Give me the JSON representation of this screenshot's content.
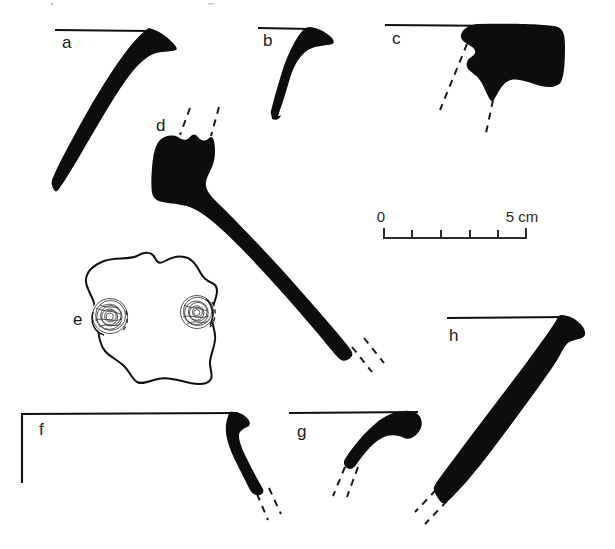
{
  "plate": {
    "kind": "archaeological-artifact-illustration-plate",
    "background_color": "#ffffff",
    "ink_color": "#0d0d0d",
    "width": 615,
    "height": 549
  },
  "figures": [
    {
      "id": "a",
      "label": "a",
      "label_x": 62,
      "label_y": 48,
      "description": "curved iron blade / knife with rim reference line at top",
      "has_rim_line": true,
      "has_break_dashes": false
    },
    {
      "id": "b",
      "label": "b",
      "label_x": 263,
      "label_y": 46,
      "description": "short tapering iron fragment with rim reference line",
      "has_rim_line": true,
      "has_break_dashes": false
    },
    {
      "id": "c",
      "label": "c",
      "label_x": 392,
      "label_y": 44,
      "description": "solid rounded rim sherd with two dashed profile projection lines",
      "has_rim_line": true,
      "has_break_dashes": true
    },
    {
      "id": "d",
      "label": "d",
      "label_x": 156,
      "label_y": 131,
      "description": "long curved hook / handle with dashed break lines at both ends",
      "has_rim_line": false,
      "has_break_dashes": true
    },
    {
      "id": "e",
      "label": "e",
      "label_x": 73,
      "label_y": 325,
      "description": "outlined irregular plate fragment with two hatched circular rivet bosses",
      "has_rim_line": false,
      "has_break_dashes": false
    },
    {
      "id": "f",
      "label": "f",
      "label_x": 39,
      "label_y": 435,
      "description": "shallow curved rim fragment with L-shaped reference axis and dashed break",
      "has_rim_line": true,
      "has_break_dashes": true
    },
    {
      "id": "g",
      "label": "g",
      "label_x": 297,
      "label_y": 437,
      "description": "short arched fragment with rim line and dashed break",
      "has_rim_line": true,
      "has_break_dashes": true
    },
    {
      "id": "h",
      "label": "h",
      "label_x": 449,
      "label_y": 341,
      "description": "long tapering shank with rim reference line and dashed break at lower end",
      "has_rim_line": true,
      "has_break_dashes": true
    }
  ],
  "scale_bar": {
    "zero_label": "0",
    "max_label": "5 cm",
    "unit": "cm",
    "min_value": 0,
    "max_value": 5,
    "divisions": 5,
    "x_start": 383,
    "x_end": 527,
    "baseline_y": 238,
    "zero_label_x": 381,
    "zero_label_y": 222,
    "max_label_x": 522,
    "max_label_y": 222
  }
}
